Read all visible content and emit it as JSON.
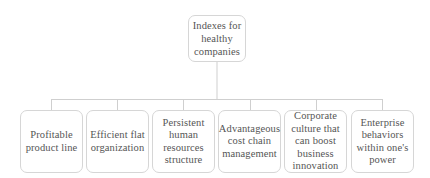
{
  "diagram": {
    "type": "hierarchy",
    "root": {
      "label": "Indexes for healthy companies"
    },
    "children": [
      {
        "label": "Profitable product line"
      },
      {
        "label": "Efficient flat organization"
      },
      {
        "label": "Persistent human resources structure"
      },
      {
        "label": "Advantageous cost chain management"
      },
      {
        "label": "Corporate culture that can boost business innovation"
      },
      {
        "label": "Enterprise behaviors within one's power"
      }
    ],
    "colors": {
      "border": "#d6d6d6",
      "connector": "#cfcfcf",
      "text": "#555555"
    }
  }
}
